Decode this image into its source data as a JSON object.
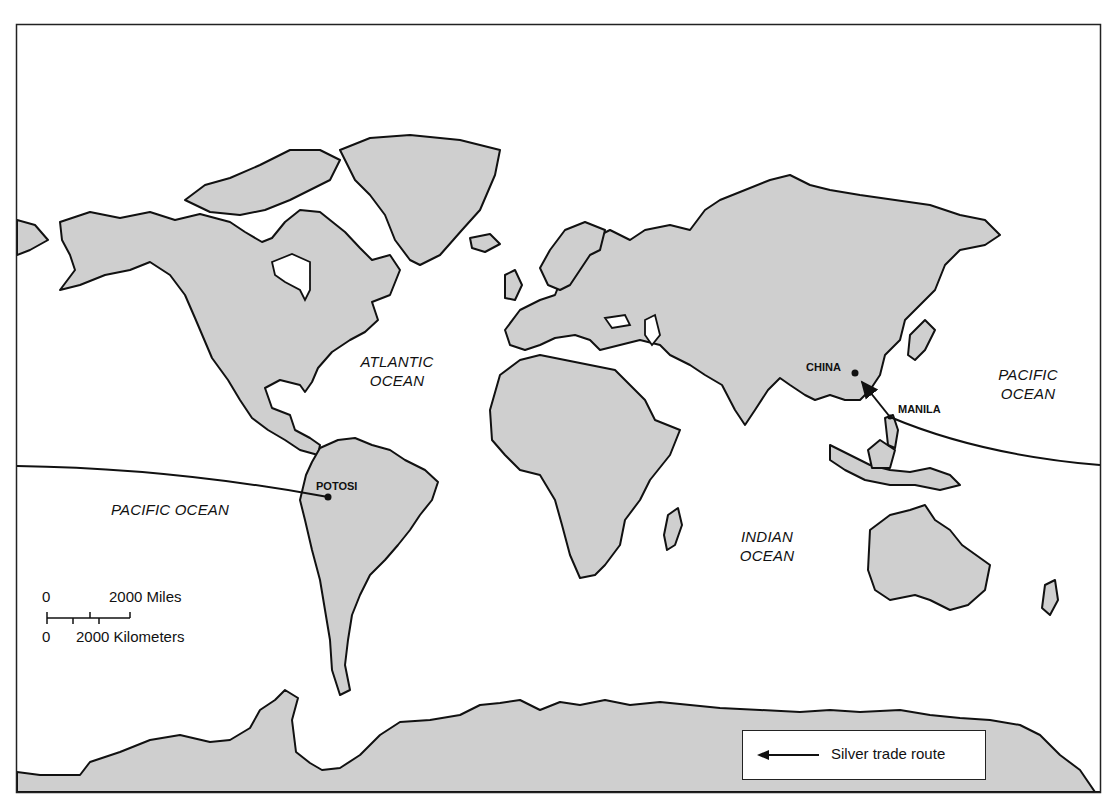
{
  "map": {
    "type": "world-map",
    "projection": "world (Pacific split)",
    "colors": {
      "land": "#cfcfcf",
      "water": "#ffffff",
      "outline": "#111111"
    }
  },
  "labels": {
    "oceans": [
      {
        "id": "atlantic",
        "lines": [
          "ATLANTIC",
          "OCEAN"
        ]
      },
      {
        "id": "pacific-west",
        "lines": [
          "PACIFIC OCEAN"
        ]
      },
      {
        "id": "indian",
        "lines": [
          "INDIAN",
          "OCEAN"
        ]
      },
      {
        "id": "pacific-east",
        "lines": [
          "PACIFIC",
          "OCEAN"
        ]
      }
    ],
    "cities": [
      {
        "id": "china",
        "label": "CHINA"
      },
      {
        "id": "manila",
        "label": "MANILA"
      },
      {
        "id": "potosi",
        "label": "POTOSI"
      }
    ]
  },
  "scale_bar": {
    "miles_zero": "0",
    "miles_label": "2000 Miles",
    "km_zero": "0",
    "km_label": "2000 Kilometers"
  },
  "legend": {
    "items": [
      {
        "symbol": "arrow-left-icon",
        "label": "Silver trade route"
      }
    ]
  },
  "route": {
    "name": "Silver trade route",
    "stops": [
      "POTOSI",
      "PACIFIC OCEAN",
      "MANILA",
      "CHINA"
    ]
  }
}
